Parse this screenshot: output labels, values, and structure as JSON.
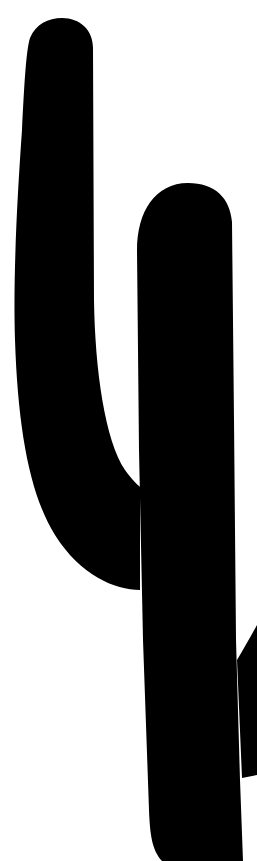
{
  "image": {
    "subject": "cactus-silhouette",
    "alt": "Black saguaro cactus silhouette",
    "colors": {
      "background": "#ffffff",
      "silhouette": "#000000"
    },
    "parts": [
      "left-arm",
      "trunk",
      "right-arm"
    ]
  }
}
